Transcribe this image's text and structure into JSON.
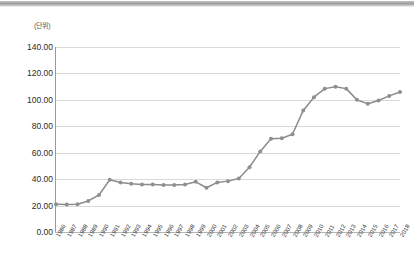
{
  "window": {
    "top_bar_color": "#9d9d9d"
  },
  "chart": {
    "unit_label": "(단위)",
    "series_color": "#8c8c8c",
    "marker_color": "#8f8f8f",
    "gridline_color": "#d9d9d9",
    "axis_color": "#9a9a9a"
  },
  "chart_data": {
    "type": "line",
    "title": "",
    "subtitle": "",
    "xlabel": "",
    "ylabel": "(단위)",
    "grid": true,
    "legend": false,
    "ylim": [
      0,
      140
    ],
    "ytick_labels": [
      "140.00",
      "120.00",
      "100.00",
      "80.00",
      "60.00",
      "40.00",
      "20.00",
      "0.00"
    ],
    "ytick_values": [
      140,
      120,
      100,
      80,
      60,
      40,
      20,
      0
    ],
    "categories": [
      "1986",
      "1987",
      "1988",
      "1989",
      "1990",
      "1991",
      "1992",
      "1993",
      "1994",
      "1995",
      "1996",
      "1997",
      "1998",
      "1999",
      "2000",
      "2001",
      "2002",
      "2003",
      "2004",
      "2005",
      "2006",
      "2007",
      "2008",
      "2009",
      "2010",
      "2011",
      "2012",
      "2013",
      "2014",
      "2015",
      "2016",
      "2017",
      "2018"
    ],
    "series": [
      {
        "name": "series-1",
        "values": [
          21.0,
          20.8,
          21.0,
          23.5,
          28.0,
          39.5,
          37.5,
          36.5,
          36.0,
          36.0,
          35.5,
          35.5,
          36.0,
          38.0,
          33.5,
          37.5,
          38.5,
          40.5,
          49.0,
          61.0,
          70.5,
          71.0,
          74.0,
          92.0,
          102.0,
          108.5,
          110.0,
          108.5,
          100.0,
          97.0,
          99.5,
          103.0,
          106.0
        ]
      }
    ]
  }
}
